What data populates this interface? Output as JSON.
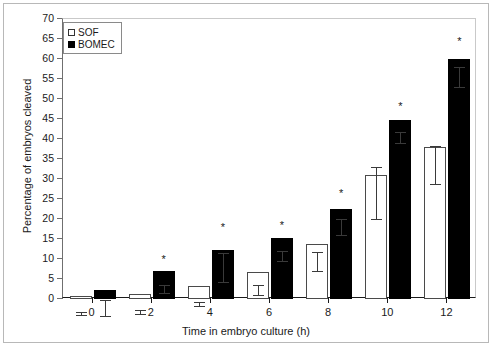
{
  "chart_data": {
    "type": "bar",
    "title": "",
    "xlabel": "Time in embryo culture (h)",
    "ylabel": "Percentage of embryos cleaved",
    "categories": [
      "0",
      "2",
      "4",
      "6",
      "8",
      "10",
      "12"
    ],
    "ylim": [
      0,
      70
    ],
    "ytick_step": 5,
    "yticks": [
      "0",
      "5",
      "10",
      "15",
      "20",
      "25",
      "30",
      "35",
      "40",
      "45",
      "50",
      "55",
      "60",
      "65",
      "70"
    ],
    "grid": false,
    "legend_position": "top-left",
    "series": [
      {
        "name": "SOF",
        "style": "open",
        "values": [
          0.8,
          1.2,
          3.3,
          6.8,
          13.8,
          31.0,
          38.0
        ],
        "errors": [
          0.4,
          0.5,
          0.5,
          1.2,
          2.4,
          6.4,
          4.8
        ],
        "significant": [
          false,
          false,
          false,
          false,
          false,
          false,
          false
        ]
      },
      {
        "name": "BOMEC",
        "style": "filled",
        "values": [
          2.3,
          7.0,
          12.3,
          15.2,
          22.5,
          44.8,
          60.0
        ],
        "errors": [
          2.0,
          1.0,
          3.6,
          1.3,
          2.0,
          1.4,
          2.5
        ],
        "significant": [
          false,
          true,
          true,
          true,
          true,
          true,
          true
        ]
      }
    ],
    "annotation_marker": "*"
  },
  "legend": {
    "items": [
      {
        "label": "SOF",
        "style": "open"
      },
      {
        "label": "BOMEC",
        "style": "filled"
      }
    ]
  },
  "axis": {
    "x_title": "Time in embryo culture (h)",
    "y_title": "Percentage of embryos cleaved"
  }
}
